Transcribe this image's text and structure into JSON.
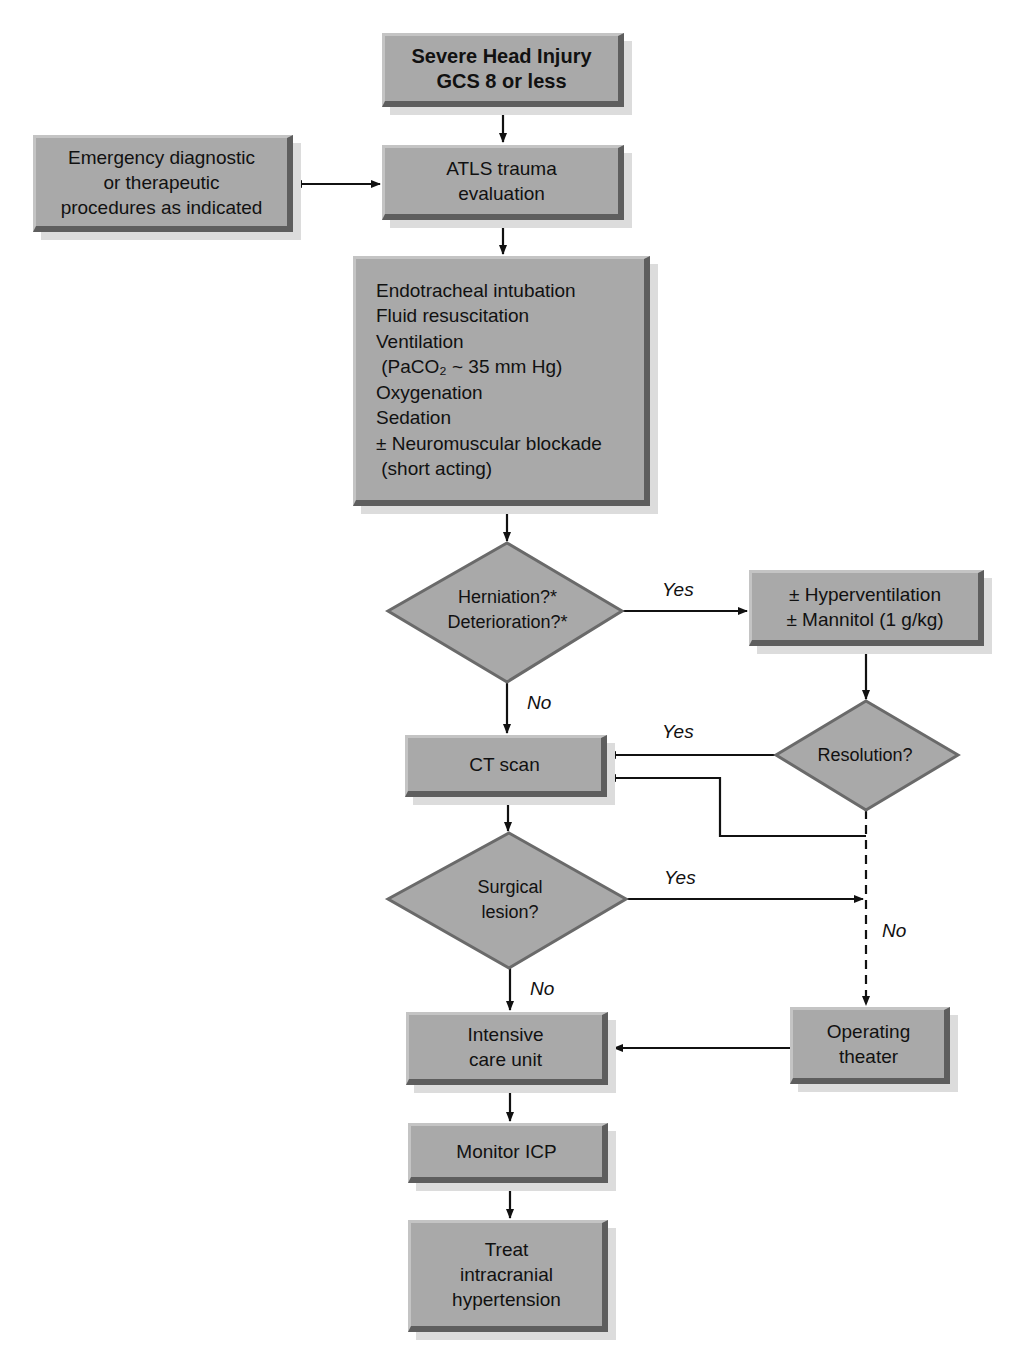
{
  "nodes": {
    "start": {
      "lines": [
        "Severe Head Injury",
        "GCS 8 or less"
      ]
    },
    "emergency": {
      "lines": [
        "Emergency diagnostic",
        "or therapeutic",
        "procedures as indicated"
      ]
    },
    "atls": {
      "lines": [
        "ATLS trauma",
        "evaluation"
      ]
    },
    "resus": {
      "lines": [
        "Endotracheal intubation",
        "Fluid resuscitation",
        "Ventilation",
        " (PaCO₂ ~ 35 mm Hg)",
        "Oxygenation",
        "Sedation",
        "± Neuromuscular blockade",
        " (short acting)"
      ]
    },
    "herniation": {
      "lines": [
        "Herniation?*",
        "Deterioration?*"
      ]
    },
    "hyper": {
      "lines": [
        "± Hyperventilation",
        "± Mannitol (1 g/kg)"
      ]
    },
    "resolution": {
      "lines": [
        "Resolution?"
      ]
    },
    "ct": {
      "lines": [
        "CT scan"
      ]
    },
    "surgical": {
      "lines": [
        "Surgical",
        "lesion?"
      ]
    },
    "icu": {
      "lines": [
        "Intensive",
        "care unit"
      ]
    },
    "or": {
      "lines": [
        "Operating",
        "theater"
      ]
    },
    "monitor": {
      "lines": [
        "Monitor ICP"
      ]
    },
    "treat": {
      "lines": [
        "Treat",
        "intracranial",
        "hypertension"
      ]
    }
  },
  "edge_labels": {
    "herniation_yes": "Yes",
    "herniation_no": "No",
    "resolution_yes": "Yes",
    "resolution_no": "No",
    "surgical_yes": "Yes",
    "surgical_no": "No"
  },
  "colors": {
    "box_fill": "#a9a9a9",
    "box_dark_edge": "#5e5e5e",
    "line": "#111111"
  }
}
